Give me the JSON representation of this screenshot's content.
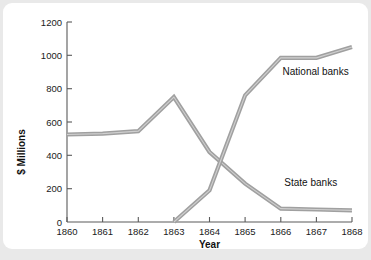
{
  "chart_data": {
    "type": "line",
    "title": "",
    "xlabel": "Year",
    "ylabel": "$ Millions",
    "x": [
      1860,
      1861,
      1862,
      1863,
      1864,
      1865,
      1866,
      1867,
      1868
    ],
    "xtick_labels": [
      "1860",
      "1861",
      "1862",
      "1863",
      "1864",
      "1865",
      "1866",
      "1867",
      "1868"
    ],
    "xlim": [
      1860,
      1868
    ],
    "ylim": [
      0,
      1200
    ],
    "ytick_labels": [
      "0",
      "200",
      "400",
      "600",
      "800",
      "1000",
      "1200"
    ],
    "yticks": [
      0,
      200,
      400,
      600,
      800,
      1000,
      1200
    ],
    "grid": false,
    "legend_position": "inline-annotations",
    "series": [
      {
        "name": "State banks",
        "label": "State banks",
        "color": "#a0a0a0",
        "values": [
          525,
          530,
          545,
          750,
          420,
          230,
          80,
          75,
          70
        ]
      },
      {
        "name": "National banks",
        "label": "National banks",
        "color": "#a0a0a0",
        "values": [
          null,
          null,
          null,
          0,
          190,
          760,
          985,
          985,
          1050
        ]
      }
    ],
    "annotations": [
      {
        "text": "National banks",
        "x": 1866.05,
        "y": 880
      },
      {
        "text": "State banks",
        "x": 1866.1,
        "y": 215
      }
    ]
  },
  "colors": {
    "page_background": "#e9e9e9",
    "card_background": "#ffffff",
    "line": "#a0a0a0",
    "line_highlight": "#cfcfcf",
    "axis": "#5a5a5a",
    "text": "#111111"
  }
}
